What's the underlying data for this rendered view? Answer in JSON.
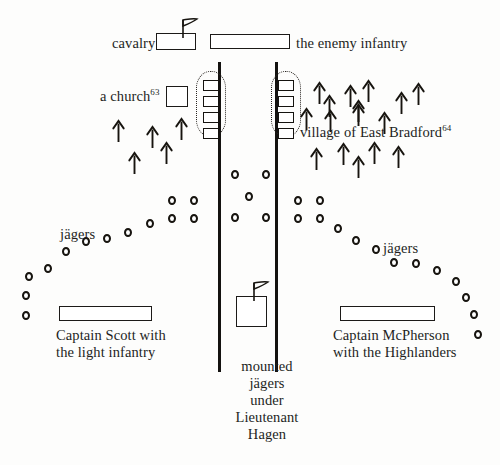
{
  "figure": {
    "type": "military-situation-map"
  },
  "labels": {
    "cavalry": "cavalry",
    "enemy_infantry": "the enemy infantry",
    "a_church": "a church",
    "a_church_note": "63",
    "village": "village of East Bradford",
    "village_note": "64",
    "jagers_left": "jägers",
    "jagers_right": "jägers",
    "scott_line1": "Captain Scott with",
    "scott_line2": "the light infantry",
    "mcpherson_line1": "Captain McPherson",
    "mcpherson_line2": "with the Highlanders",
    "mounted_line1": "mounted",
    "mounted_line2": "jägers",
    "mounted_line3": "under",
    "mounted_line4": "Lieutenant",
    "mounted_line5": "Hagen"
  },
  "colors": {
    "ink": "#17140f",
    "paper": "#fdfdfc",
    "rule": "#141210"
  },
  "symbols": {
    "cavalry_box": {
      "x": 156,
      "y": 33,
      "w": 40,
      "h": 17,
      "flag": true
    },
    "enemy_infantry_box": {
      "x": 210,
      "y": 34,
      "w": 80,
      "h": 15,
      "flag": false
    },
    "church_box": {
      "x": 166,
      "y": 86,
      "w": 22,
      "h": 21
    },
    "scott_box": {
      "x": 59,
      "y": 306,
      "w": 93,
      "h": 15
    },
    "mcpherson_box": {
      "x": 340,
      "y": 306,
      "w": 95,
      "h": 15
    },
    "mounted_box": {
      "x": 236,
      "y": 296,
      "w": 31,
      "h": 31,
      "flag": true
    }
  },
  "roads": [
    {
      "x": 218,
      "y": 62,
      "h": 310
    },
    {
      "x": 275,
      "y": 62,
      "h": 310
    }
  ],
  "village_houses": {
    "left_x": 203,
    "right_x": 278,
    "w": 16,
    "h": 11,
    "rows_y": [
      80,
      96,
      112,
      128
    ]
  },
  "village_rings": [
    {
      "x": 196,
      "y": 71,
      "w": 30,
      "h": 66
    },
    {
      "x": 271,
      "y": 71,
      "w": 30,
      "h": 66
    }
  ],
  "arrows_left": [
    {
      "x": 112,
      "y": 120
    },
    {
      "x": 146,
      "y": 126
    },
    {
      "x": 175,
      "y": 118
    },
    {
      "x": 160,
      "y": 142
    },
    {
      "x": 128,
      "y": 152
    }
  ],
  "arrows_right": [
    {
      "x": 313,
      "y": 82
    },
    {
      "x": 323,
      "y": 95
    },
    {
      "x": 344,
      "y": 85
    },
    {
      "x": 362,
      "y": 80
    },
    {
      "x": 352,
      "y": 100
    },
    {
      "x": 395,
      "y": 92
    },
    {
      "x": 412,
      "y": 83
    },
    {
      "x": 300,
      "y": 108
    },
    {
      "x": 324,
      "y": 110
    },
    {
      "x": 352,
      "y": 104
    },
    {
      "x": 378,
      "y": 112
    },
    {
      "x": 310,
      "y": 148
    },
    {
      "x": 337,
      "y": 143
    },
    {
      "x": 352,
      "y": 156
    },
    {
      "x": 368,
      "y": 142
    },
    {
      "x": 392,
      "y": 146
    }
  ],
  "circles_left": [
    {
      "x": 168,
      "y": 196
    },
    {
      "x": 190,
      "y": 196
    },
    {
      "x": 168,
      "y": 214
    },
    {
      "x": 190,
      "y": 214
    },
    {
      "x": 146,
      "y": 219
    },
    {
      "x": 124,
      "y": 228
    },
    {
      "x": 103,
      "y": 234
    },
    {
      "x": 82,
      "y": 237
    },
    {
      "x": 62,
      "y": 247
    },
    {
      "x": 44,
      "y": 264
    },
    {
      "x": 25,
      "y": 272
    },
    {
      "x": 22,
      "y": 291
    },
    {
      "x": 22,
      "y": 311
    }
  ],
  "circles_center": [
    {
      "x": 231,
      "y": 170
    },
    {
      "x": 262,
      "y": 170
    },
    {
      "x": 245,
      "y": 192
    },
    {
      "x": 231,
      "y": 213
    },
    {
      "x": 262,
      "y": 213
    }
  ],
  "circles_right": [
    {
      "x": 294,
      "y": 196
    },
    {
      "x": 316,
      "y": 196
    },
    {
      "x": 294,
      "y": 214
    },
    {
      "x": 316,
      "y": 214
    },
    {
      "x": 334,
      "y": 224
    },
    {
      "x": 352,
      "y": 236
    },
    {
      "x": 372,
      "y": 245
    },
    {
      "x": 390,
      "y": 258
    },
    {
      "x": 412,
      "y": 259
    },
    {
      "x": 433,
      "y": 266
    },
    {
      "x": 452,
      "y": 277
    },
    {
      "x": 462,
      "y": 293
    },
    {
      "x": 470,
      "y": 310
    },
    {
      "x": 474,
      "y": 330
    }
  ],
  "text_positions": {
    "cavalry": {
      "x": 112,
      "y": 35
    },
    "enemy_infantry": {
      "x": 296,
      "y": 35
    },
    "a_church": {
      "x": 100,
      "y": 88
    },
    "village": {
      "x": 300,
      "y": 124
    },
    "jagers_left": {
      "x": 60,
      "y": 226
    },
    "jagers_right": {
      "x": 383,
      "y": 240
    },
    "scott": {
      "x": 56,
      "y": 327
    },
    "mcpherson": {
      "x": 333,
      "y": 327
    },
    "mounted": {
      "x": 217,
      "y": 358
    }
  }
}
